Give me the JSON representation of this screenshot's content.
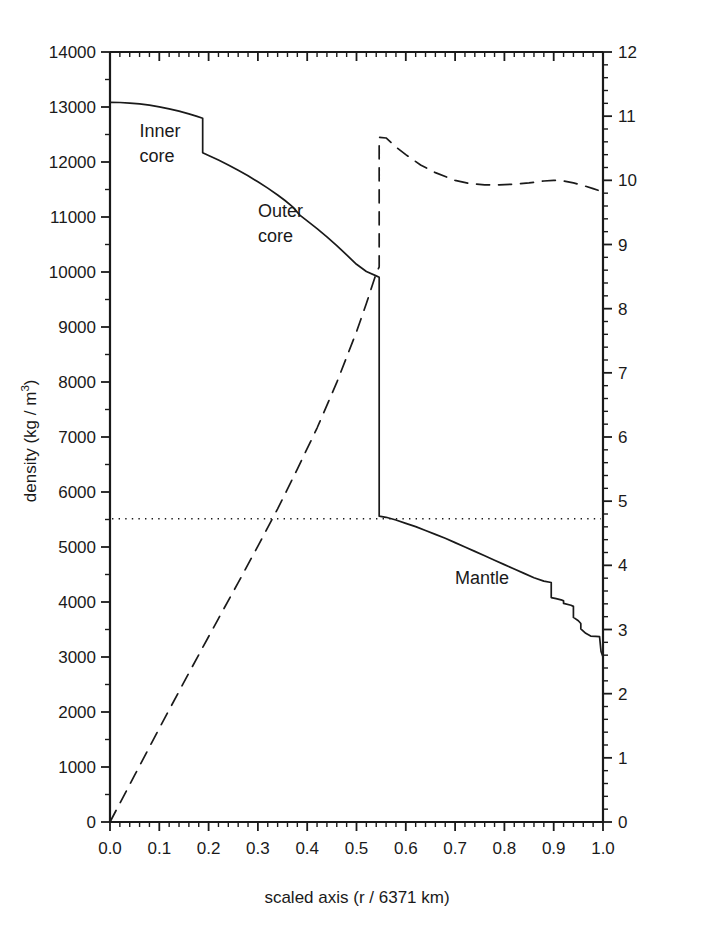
{
  "chart_data": {
    "type": "line",
    "title": "",
    "xlabel": "scaled axis (r / 6371 km)",
    "ylabel": "density (kg / m<sup>3</sup>)",
    "ylabel_plain": "density (kg / m3)",
    "y2label": "gravitational acceleration (m/s<sup>2</sup>)",
    "y2label_plain": "gravitational acceleration (m/s2)",
    "xlim": [
      0.0,
      1.0
    ],
    "ylim": [
      0,
      14000
    ],
    "y2lim": [
      0,
      12
    ],
    "grid": false,
    "legend": "none",
    "xticks": [
      "0.0",
      "0.1",
      "0.2",
      "0.3",
      "0.4",
      "0.5",
      "0.6",
      "0.7",
      "0.8",
      "0.9",
      "1.0"
    ],
    "xtick_values": [
      0.0,
      0.1,
      0.2,
      0.3,
      0.4,
      0.5,
      0.6,
      0.7,
      0.8,
      0.9,
      1.0
    ],
    "yticks": [
      "0",
      "1000",
      "2000",
      "3000",
      "4000",
      "5000",
      "6000",
      "7000",
      "8000",
      "9000",
      "10000",
      "11000",
      "12000",
      "13000",
      "14000"
    ],
    "ytick_values": [
      0,
      1000,
      2000,
      3000,
      4000,
      5000,
      6000,
      7000,
      8000,
      9000,
      10000,
      11000,
      12000,
      13000,
      14000
    ],
    "y2ticks": [
      "0",
      "1",
      "2",
      "3",
      "4",
      "5",
      "6",
      "7",
      "8",
      "9",
      "10",
      "11",
      "12"
    ],
    "y2tick_values": [
      0,
      1,
      2,
      3,
      4,
      5,
      6,
      7,
      8,
      9,
      10,
      11,
      12
    ],
    "minor_ticks_per_interval": 5,
    "annotations": [
      {
        "text": "Inner core",
        "line1": "Inner",
        "line2": "core",
        "x": 0.06,
        "y": 12450
      },
      {
        "text": "Outer core",
        "line1": "Outer",
        "line2": "core",
        "x": 0.3,
        "y": 11000
      },
      {
        "text": "Mantle",
        "line1": "Mantle",
        "line2": "",
        "x": 0.7,
        "y": 4320
      }
    ],
    "series": [
      {
        "name": "density",
        "axis": "left",
        "style": "solid",
        "color": "#1a1a1a",
        "points": [
          [
            0.0,
            13085
          ],
          [
            0.02,
            13082
          ],
          [
            0.04,
            13072
          ],
          [
            0.06,
            13056
          ],
          [
            0.08,
            13033
          ],
          [
            0.1,
            13003
          ],
          [
            0.12,
            12967
          ],
          [
            0.14,
            12925
          ],
          [
            0.16,
            12875
          ],
          [
            0.175,
            12834
          ],
          [
            0.188,
            12795
          ],
          [
            0.188,
            12170
          ],
          [
            0.2,
            12120
          ],
          [
            0.22,
            12035
          ],
          [
            0.24,
            11945
          ],
          [
            0.26,
            11850
          ],
          [
            0.28,
            11750
          ],
          [
            0.3,
            11640
          ],
          [
            0.32,
            11525
          ],
          [
            0.34,
            11400
          ],
          [
            0.355,
            11300
          ],
          [
            0.37,
            11190
          ],
          [
            0.385,
            11035
          ],
          [
            0.4,
            10930
          ],
          [
            0.42,
            10790
          ],
          [
            0.44,
            10640
          ],
          [
            0.46,
            10480
          ],
          [
            0.48,
            10310
          ],
          [
            0.5,
            10140
          ],
          [
            0.52,
            10010
          ],
          [
            0.54,
            9930
          ],
          [
            0.546,
            9905
          ],
          [
            0.546,
            5560
          ],
          [
            0.56,
            5540
          ],
          [
            0.58,
            5490
          ],
          [
            0.6,
            5430
          ],
          [
            0.62,
            5370
          ],
          [
            0.64,
            5300
          ],
          [
            0.66,
            5230
          ],
          [
            0.68,
            5160
          ],
          [
            0.7,
            5080
          ],
          [
            0.72,
            5000
          ],
          [
            0.74,
            4920
          ],
          [
            0.76,
            4840
          ],
          [
            0.78,
            4760
          ],
          [
            0.8,
            4680
          ],
          [
            0.82,
            4600
          ],
          [
            0.84,
            4520
          ],
          [
            0.86,
            4440
          ],
          [
            0.88,
            4380
          ],
          [
            0.895,
            4355
          ],
          [
            0.895,
            4080
          ],
          [
            0.905,
            4060
          ],
          [
            0.915,
            4040
          ],
          [
            0.92,
            4020
          ],
          [
            0.92,
            3975
          ],
          [
            0.935,
            3940
          ],
          [
            0.94,
            3920
          ],
          [
            0.94,
            3720
          ],
          [
            0.95,
            3660
          ],
          [
            0.955,
            3610
          ],
          [
            0.955,
            3510
          ],
          [
            0.965,
            3430
          ],
          [
            0.975,
            3380
          ],
          [
            0.975,
            3380
          ],
          [
            0.985,
            3375
          ],
          [
            0.993,
            3370
          ],
          [
            0.993,
            3370
          ],
          [
            0.996,
            3100
          ],
          [
            1.0,
            3000
          ]
        ]
      },
      {
        "name": "gravitational acceleration",
        "axis": "right",
        "style": "dashed",
        "color": "#1a1a1a",
        "points": [
          [
            0.0,
            0.0
          ],
          [
            0.05,
            0.73
          ],
          [
            0.1,
            1.46
          ],
          [
            0.15,
            2.18
          ],
          [
            0.188,
            2.72
          ],
          [
            0.22,
            3.17
          ],
          [
            0.26,
            3.73
          ],
          [
            0.3,
            4.3
          ],
          [
            0.34,
            4.88
          ],
          [
            0.38,
            5.5
          ],
          [
            0.42,
            6.14
          ],
          [
            0.46,
            6.85
          ],
          [
            0.5,
            7.64
          ],
          [
            0.52,
            8.08
          ],
          [
            0.54,
            8.55
          ],
          [
            0.546,
            8.65
          ],
          [
            0.546,
            10.67
          ],
          [
            0.56,
            10.66
          ],
          [
            0.58,
            10.52
          ],
          [
            0.6,
            10.4
          ],
          [
            0.63,
            10.24
          ],
          [
            0.66,
            10.12
          ],
          [
            0.7,
            10.0
          ],
          [
            0.73,
            9.95
          ],
          [
            0.76,
            9.93
          ],
          [
            0.79,
            9.93
          ],
          [
            0.82,
            9.94
          ],
          [
            0.85,
            9.96
          ],
          [
            0.88,
            9.99
          ],
          [
            0.9,
            10.0
          ],
          [
            0.92,
            9.99
          ],
          [
            0.94,
            9.96
          ],
          [
            0.96,
            9.92
          ],
          [
            0.98,
            9.87
          ],
          [
            1.0,
            9.82
          ]
        ]
      }
    ],
    "reference_lines": [
      {
        "name": "mean-earth-density",
        "orientation": "horizontal",
        "axis": "left",
        "value": 5515,
        "style": "dotted",
        "color": "#1a1a1a"
      }
    ]
  }
}
